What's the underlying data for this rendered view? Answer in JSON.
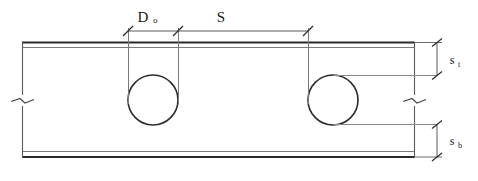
{
  "drawing": {
    "title": "Plate section with circular openings",
    "type": "engineering-section-detail",
    "background_color": "#ffffff",
    "line_color": "#2b2b2b",
    "thin_line_color": "#6a6a6a",
    "text_color": "#1a1a1a"
  },
  "dimensions": {
    "hole_diameter": {
      "symbol": "D",
      "subscript": "o",
      "full": "Do"
    },
    "hole_spacing": {
      "symbol": "S",
      "subscript": "",
      "full": "S"
    },
    "top_edge_distance": {
      "symbol": "s",
      "subscript": "t",
      "full": "st"
    },
    "bottom_edge_distance": {
      "symbol": "s",
      "subscript": "b",
      "full": "sb"
    }
  },
  "geometry": {
    "plate_left_x": 22,
    "plate_right_x": 414,
    "top_flange_outer_y": 42,
    "top_flange_inner_y": 47,
    "bottom_flange_inner_y": 152,
    "bottom_flange_outer_y": 157,
    "holes": [
      {
        "cx": 153,
        "cy": 100,
        "r": 25
      },
      {
        "cx": 333,
        "cy": 100,
        "r": 25
      }
    ],
    "top_dimension_line_y": 31,
    "dim_tick_x_positions": [
      128,
      178,
      308
    ],
    "right_dimension_x": 437,
    "break_symbol_left_x": 22,
    "break_symbol_right_x": 414,
    "break_symbol_y": 100
  },
  "elements": {
    "top_flange": "top-flange-plate",
    "bottom_flange": "bottom-flange-plate",
    "web": "web-panel",
    "hole_first": "circular-opening-1",
    "hole_second": "circular-opening-2",
    "break_left": "break-line-left",
    "break_right": "break-line-right"
  }
}
